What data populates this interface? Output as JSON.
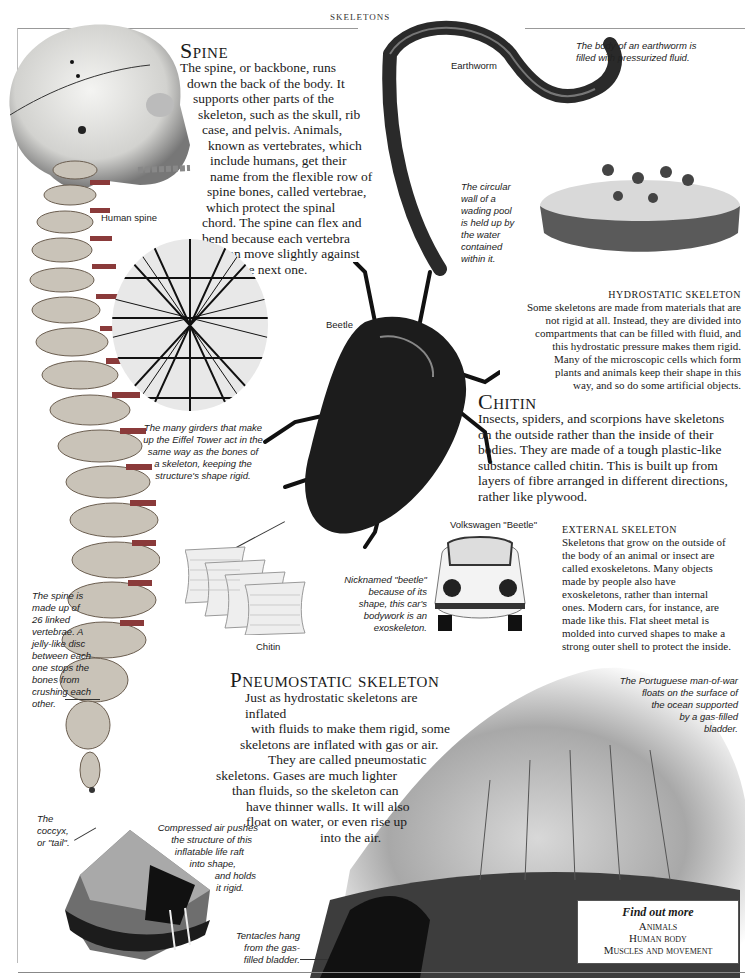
{
  "header": {
    "section_title": "SKELETONS"
  },
  "spine": {
    "heading": "Spine",
    "lines": [
      "The spine, or backbone, runs",
      "down the back of the body. It",
      "supports other parts of the",
      "skeleton, such as the skull, rib",
      "case, and pelvis. Animals,",
      "known as vertebrates, which",
      "include humans, get their",
      "name from the flexible row of",
      "spine bones, called vertebrae,",
      "which protect the spinal",
      "chord. The spine can flex and",
      "bend because each vertebra",
      "can move slightly against",
      "the next one."
    ],
    "label_human_spine": "Human spine",
    "caption_vertebrae": [
      "The spine is",
      "made up of",
      "26 linked",
      "vertebrae. A",
      "jelly-like disc",
      "between each",
      "one stops the",
      "bones from",
      "crushing each",
      "other."
    ],
    "caption_coccyx": [
      "The",
      "coccyx,",
      "or \"tail\"."
    ]
  },
  "earthworm": {
    "label": "Earthworm",
    "caption": [
      "The body of an earthworm is",
      "filled with pressurized fluid."
    ]
  },
  "wading_pool": {
    "caption": [
      "The circular",
      "wall of a",
      "wading pool",
      "is held up by",
      "the water",
      "contained",
      "within it."
    ]
  },
  "hydrostatic": {
    "heading": "HYDROSTATIC SKELETON",
    "lines": [
      "Some skeletons are made from materials that are",
      "not rigid at all. Instead, they are divided into",
      "compartments that can be filled with fluid, and",
      "this hydrostatic pressure makes them rigid.",
      "Many of the microscopic cells which form",
      "plants and animals keep their shape in this",
      "way, and so do some artificial objects."
    ]
  },
  "eiffel": {
    "caption": [
      "The many girders that make",
      "up the Eiffel Tower act in the",
      "same way as the bones of",
      "a skeleton, keeping the",
      "structure's shape rigid."
    ]
  },
  "beetle": {
    "label": "Beetle"
  },
  "chitin": {
    "heading": "Chitin",
    "lines": [
      "Insects, spiders, and scorpions have skeletons",
      "on the outside rather than the inside of their",
      "bodies. They are made of a tough plastic-like",
      "substance called chitin. This is built up from",
      "layers of fibre arranged in different directions,",
      "rather like plywood."
    ],
    "diagram_label": "Chitin"
  },
  "vw": {
    "label": "Volkswagen \"Beetle\"",
    "caption": [
      "Nicknamed \"beetle\"",
      "because of its",
      "shape, this car's",
      "bodywork is an",
      "exoskeleton."
    ]
  },
  "external": {
    "heading": "EXTERNAL SKELETON",
    "lines": [
      "Skeletons that grow on the outside of",
      "the body of an animal or insect are",
      "called exoskeletons. Many objects",
      "made by people also have",
      "exoskeletons, rather than internal",
      "ones. Modern cars, for instance, are",
      "made like this. Flat sheet metal is",
      "molded into curved shapes to make a",
      "strong outer shell to protect the inside."
    ]
  },
  "pneumostatic": {
    "heading": "Pneumostatic skeleton",
    "lines": [
      "Just as hydrostatic skeletons are inflated",
      "with fluids to make them rigid, some",
      "skeletons are inflated with gas or air.",
      "They are called pneumostatic",
      "skeletons. Gases are much lighter",
      "than fluids, so the skeleton can",
      "have thinner walls. It will also",
      "float on water, or even rise up",
      "into the air."
    ]
  },
  "manofwar": {
    "caption": [
      "The Portuguese man-of-war",
      "floats on the surface of",
      "the ocean supported",
      "by a gas-filled",
      "bladder."
    ],
    "tentacles_caption": [
      "Tentacles hang",
      "from the gas-",
      "filled bladder."
    ]
  },
  "liferaft": {
    "caption": [
      "Compressed air pushes",
      "the structure of this",
      "inflatable life raft",
      "into shape,",
      "and holds",
      "it rigid."
    ]
  },
  "find_out_more": {
    "title": "Find out more",
    "items": [
      "Animals",
      "Human body",
      "Muscles and movement"
    ]
  }
}
